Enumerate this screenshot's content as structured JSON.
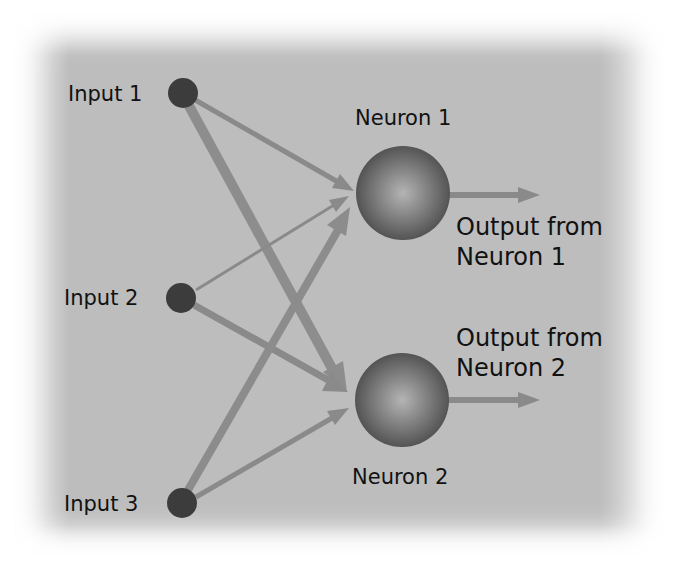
{
  "diagram": {
    "type": "neural-network",
    "colors": {
      "background": "#bdbdbd",
      "input_node": "#3c3c3c",
      "neuron_dark": "#4a4a4a",
      "neuron_light": "#b0b0b0",
      "arrow": "#8a8a8a",
      "text": "#111111"
    },
    "inputs": [
      {
        "id": "input-1",
        "label": "Input 1"
      },
      {
        "id": "input-2",
        "label": "Input 2"
      },
      {
        "id": "input-3",
        "label": "Input 3"
      }
    ],
    "neurons": [
      {
        "id": "neuron-1",
        "label": "Neuron 1",
        "output_label_line1": "Output from",
        "output_label_line2": "Neuron 1"
      },
      {
        "id": "neuron-2",
        "label": "Neuron 2",
        "output_label_line1": "Output from",
        "output_label_line2": "Neuron 2"
      }
    ],
    "edges": [
      {
        "from": "input-1",
        "to": "neuron-1",
        "weight": "medium-thin"
      },
      {
        "from": "input-1",
        "to": "neuron-2",
        "weight": "thick"
      },
      {
        "from": "input-2",
        "to": "neuron-1",
        "weight": "thin"
      },
      {
        "from": "input-2",
        "to": "neuron-2",
        "weight": "medium"
      },
      {
        "from": "input-3",
        "to": "neuron-1",
        "weight": "medium-thick"
      },
      {
        "from": "input-3",
        "to": "neuron-2",
        "weight": "medium-thin"
      },
      {
        "from": "neuron-1",
        "to": "output-1",
        "weight": "medium"
      },
      {
        "from": "neuron-2",
        "to": "output-2",
        "weight": "medium"
      }
    ]
  }
}
